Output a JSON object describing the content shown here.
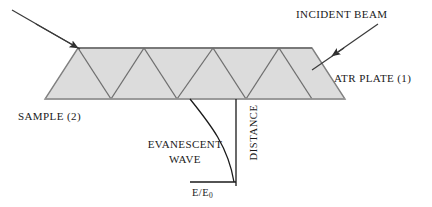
{
  "figure": {
    "background_color": "#ffffff",
    "plate_fill_color": "#dcdcdc",
    "plate_stroke_color": "#808080",
    "beam_color": "#555555",
    "curve_color": "#1a1a1a",
    "text_color": "#1a1a1a"
  },
  "labels": {
    "incident_beam": "INCIDENT BEAM",
    "atr_plate": "ATR PLATE (1)",
    "sample": "SAMPLE (2)",
    "evanescent_wave_line1": "EVANESCENT",
    "evanescent_wave_line2": "WAVE",
    "distance": "DISTANCE",
    "e_ratio_numerator": "E/E",
    "e_ratio_subscript": "0"
  },
  "geometry": {
    "plate": {
      "top_left_x": 78,
      "top_right_x": 312,
      "bottom_left_x": 45,
      "bottom_right_x": 345,
      "top_y": 48,
      "bottom_y": 99
    },
    "internal_reflection_bounces_top": 3,
    "internal_reflection_bounces_bottom": 3,
    "decay_curve_origin_x": 190,
    "decay_curve_origin_y": 99,
    "decay_curve_baseline_y": 182,
    "decay_curve_end_x": 235
  }
}
